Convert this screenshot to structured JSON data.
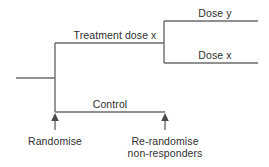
{
  "diagram": {
    "type": "clinical-trial-randomisation-tree",
    "line_color": "#6b6b6b",
    "text_color": "#303030",
    "background_color": "#ffffff",
    "branches": {
      "treatment": "Treatment dose x",
      "control": "Control",
      "dose_y": "Dose y",
      "dose_x": "Dose x"
    },
    "annotations": {
      "randomise": "Randomise",
      "rerandomise_line1": "Re-randomise",
      "rerandomise_line2": "non-responders"
    }
  }
}
